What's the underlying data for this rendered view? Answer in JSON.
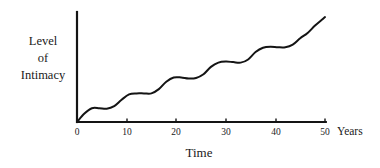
{
  "chart_data": {
    "type": "line",
    "title": "",
    "subtitle": "",
    "xlabel": "Time",
    "x_unit_label": "Years",
    "ylabel_lines": [
      "Level",
      "of",
      "Intimacy"
    ],
    "ylabel": "Level of Intimacy",
    "xlim": [
      0,
      50
    ],
    "xticks": [
      0,
      10,
      20,
      30,
      40,
      50
    ],
    "xtick_labels": [
      "0",
      "10",
      "20",
      "30",
      "40",
      "50"
    ],
    "yticks": [],
    "ytick_labels": [],
    "ylim": [
      0,
      100
    ],
    "grid": false,
    "legend": null,
    "legend_position": "none",
    "axis_style": "open-left-bottom-spines",
    "series": [
      {
        "name": "Level of Intimacy",
        "color": "#141414",
        "line_width": 2.0,
        "x": [
          0,
          1.5,
          3,
          4.5,
          6,
          7.5,
          9,
          10.5,
          12,
          13.5,
          15,
          16.5,
          18,
          19.5,
          21,
          22.5,
          24,
          25.5,
          27,
          28.5,
          30,
          31.5,
          33,
          34.5,
          36,
          37.5,
          39,
          40.5,
          42,
          43.5,
          45,
          46.5,
          48,
          49.5,
          50
        ],
        "values": [
          0,
          8,
          13,
          13,
          12.5,
          15,
          21,
          26,
          27,
          27,
          27,
          31,
          38,
          42,
          42,
          41,
          41.5,
          45,
          52,
          56,
          57,
          56.5,
          56,
          59,
          66,
          70,
          71,
          70.5,
          70.5,
          73,
          79,
          84,
          91,
          97,
          99
        ],
        "annotations": []
      }
    ]
  },
  "axis": {
    "y_axis_name": "y-axis",
    "x_axis_name": "x-axis"
  }
}
